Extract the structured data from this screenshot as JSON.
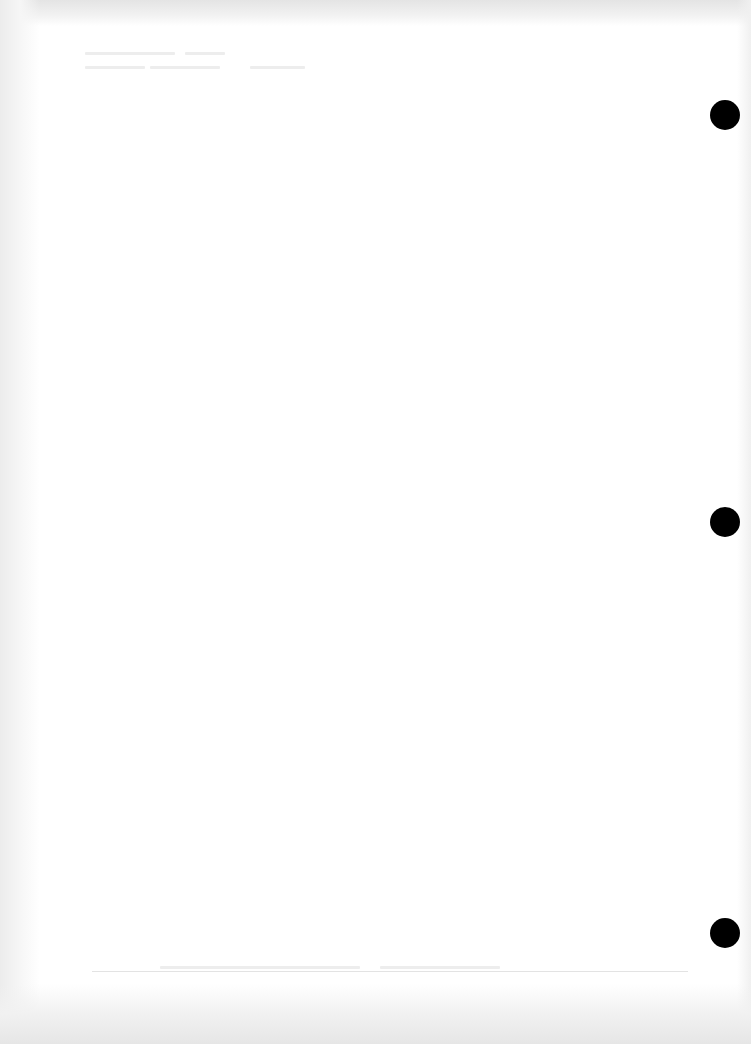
{
  "document": {
    "type": "scanned blank page",
    "legible_text": "",
    "note": "No legible content; only faint show-through from the reverse side is visible."
  },
  "punch_holes": [
    {
      "cx": 725,
      "cy": 115
    },
    {
      "cx": 725,
      "cy": 522
    },
    {
      "cx": 725,
      "cy": 933
    }
  ],
  "colors": {
    "paper": "#ffffff",
    "scan_border": "#e6e6e6",
    "bleed_through": "#ededed",
    "punch_hole": "#000000"
  }
}
